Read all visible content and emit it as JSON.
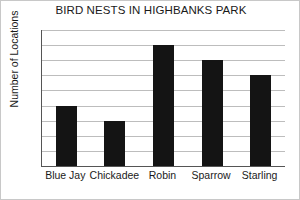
{
  "chart_data": {
    "type": "bar",
    "title": "BIRD NESTS IN HIGHBANKS PARK",
    "xlabel": "",
    "ylabel": "Number of Locations",
    "categories": [
      "Blue Jay",
      "Chickadee",
      "Robin",
      "Sparrow",
      "Starling"
    ],
    "values": [
      4,
      3,
      8,
      7,
      6
    ],
    "ylim": [
      0,
      9
    ],
    "ytick_labels": [
      "0",
      "1",
      "2",
      "3",
      "4",
      "5",
      "6",
      "7",
      "8",
      "9"
    ],
    "ytick_values": [
      0,
      1,
      2,
      3,
      4,
      5,
      6,
      7,
      8,
      9
    ],
    "grid": true,
    "legend": false,
    "bar_color": "#141414",
    "grid_color": "#bdbdbd",
    "axis_color": "#555555",
    "background_color": "#ffffff",
    "text_color": "#1a1a1a"
  }
}
